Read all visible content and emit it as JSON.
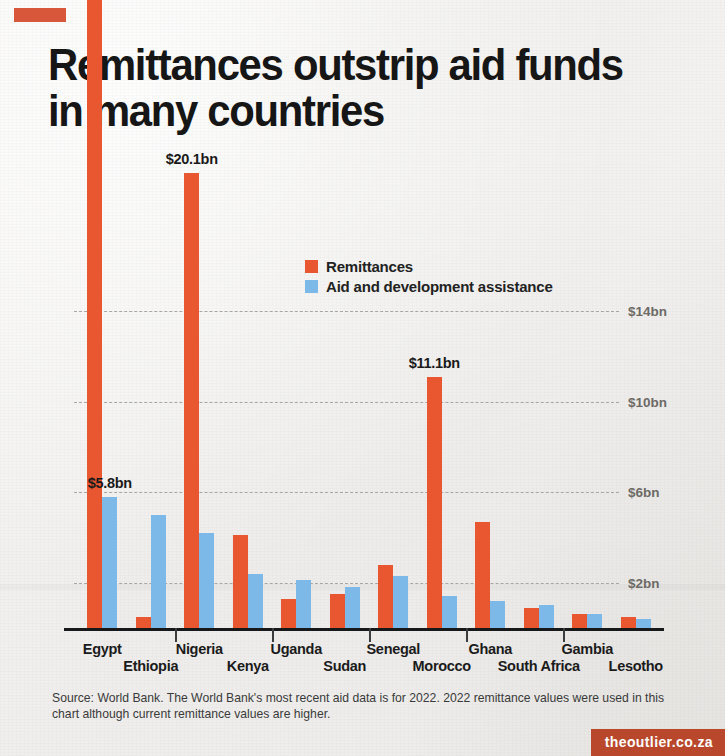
{
  "branding": {
    "top_mark_color": "#d8573a",
    "credit": "theoutlier.co.za",
    "credit_bg": "#b8472b"
  },
  "header": {
    "title": "Remittances outstrip aid funds in many countries"
  },
  "source": {
    "text": "Source: World Bank. The World Bank's most recent aid data is for 2022. 2022 remittance values were used in this chart although current remittance values are higher."
  },
  "chart_data": {
    "type": "bar",
    "title": "Remittances outstrip aid funds in many countries",
    "xlabel": "",
    "ylabel": "",
    "grid": true,
    "legend_position": "top-center",
    "ylim": [
      0,
      29
    ],
    "yticks": [
      2,
      6,
      10,
      14
    ],
    "ytick_labels": [
      "$2bn",
      "$6bn",
      "$10bn",
      "$14bn"
    ],
    "colors": {
      "remittances": "#e8572f",
      "aid": "#7cb9e8"
    },
    "categories": [
      "Egypt",
      "Ethiopia",
      "Nigeria",
      "Kenya",
      "Uganda",
      "Sudan",
      "Senegal",
      "Morocco",
      "Ghana",
      "South Africa",
      "Gambia",
      "Lesotho"
    ],
    "series": [
      {
        "name": "Remittances",
        "color": "#e8572f",
        "values": [
          28.3,
          0.5,
          20.1,
          4.1,
          1.3,
          1.5,
          2.8,
          11.1,
          4.7,
          0.9,
          0.6,
          0.5
        ]
      },
      {
        "name": "Aid and development assistance",
        "color": "#7cb9e8",
        "values": [
          5.8,
          5.0,
          4.2,
          2.4,
          2.1,
          1.8,
          2.3,
          1.4,
          1.2,
          1.0,
          0.6,
          0.4
        ]
      }
    ],
    "annotations": [
      {
        "text": "US $28.3bn",
        "series": "Remittances",
        "category": "Egypt"
      },
      {
        "text": "$5.8bn",
        "series": "Aid and development assistance",
        "category": "Egypt"
      },
      {
        "text": "$20.1bn",
        "series": "Remittances",
        "category": "Nigeria"
      },
      {
        "text": "$11.1bn",
        "series": "Remittances",
        "category": "Morocco"
      }
    ]
  },
  "legend": {
    "items": [
      {
        "label": "Remittances",
        "color": "#e8572f"
      },
      {
        "label": "Aid and development assistance",
        "color": "#7cb9e8"
      }
    ]
  }
}
